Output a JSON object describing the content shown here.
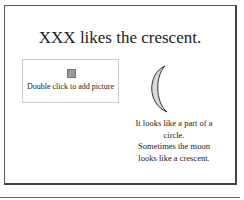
{
  "slide": {
    "title": "XXX likes the crescent.",
    "picture_placeholder": {
      "label": "Double click to add picture",
      "icon": "picture-icon"
    },
    "shape": "crescent-moon",
    "body_lines": [
      "It looks like a part of a circle.",
      "Sometimes the moon",
      "looks like a crescent."
    ]
  }
}
